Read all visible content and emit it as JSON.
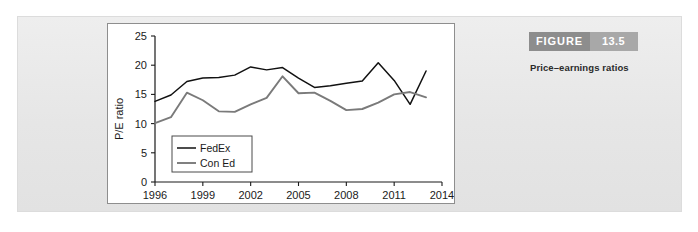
{
  "figure": {
    "badge_word": "FIGURE",
    "badge_number": "13.5",
    "caption": "Price–earnings ratios",
    "badge_word_color": "#8d8d8d",
    "badge_number_color": "#a8a8a8"
  },
  "chart_data": {
    "type": "line",
    "title": "",
    "xlabel": "",
    "ylabel": "P/E ratio",
    "xlim": [
      1996,
      2014
    ],
    "ylim": [
      0,
      25
    ],
    "yticks": [
      0,
      5,
      10,
      15,
      20,
      25
    ],
    "ytick_labels": [
      "0",
      "5",
      "10",
      "15",
      "20",
      "25"
    ],
    "xticks": [
      1996,
      1999,
      2002,
      2005,
      2008,
      2011,
      2014
    ],
    "xtick_labels": [
      "1996",
      "1999",
      "2002",
      "2005",
      "2008",
      "2011",
      "2014"
    ],
    "grid": false,
    "legend_position": "lower-left-inside",
    "x": [
      1996,
      1997,
      1998,
      1999,
      2000,
      2001,
      2002,
      2003,
      2004,
      2005,
      2006,
      2007,
      2008,
      2009,
      2010,
      2011,
      2012,
      2013
    ],
    "series": [
      {
        "name": "FedEx",
        "color": "#111111",
        "values": [
          13.8,
          14.9,
          17.2,
          17.8,
          17.9,
          18.3,
          19.7,
          19.2,
          19.6,
          17.8,
          16.2,
          16.5,
          16.9,
          17.3,
          20.4,
          17.4,
          13.3,
          19.0
        ]
      },
      {
        "name": "Con Ed",
        "color": "#7a7a7a",
        "values": [
          10.1,
          11.1,
          15.3,
          14.0,
          12.1,
          12.0,
          13.3,
          14.4,
          18.1,
          15.2,
          15.3,
          13.9,
          12.3,
          12.5,
          13.6,
          15.0,
          15.4,
          14.5
        ]
      }
    ]
  }
}
